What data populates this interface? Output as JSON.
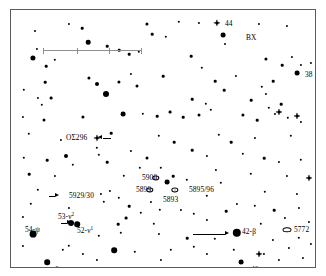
{
  "chart_data": {
    "type": "scatter",
    "title": "",
    "subtitle": "",
    "xlabel": "",
    "ylabel": "",
    "grid": false,
    "legend_position": "none",
    "xlim": [
      0,
      306
    ],
    "ylim": [
      0,
      259
    ],
    "scale_bar": {
      "x_start": 32,
      "x_end": 130,
      "y": 40,
      "ticks": [
        32,
        65.5,
        98,
        130
      ]
    },
    "labels": [
      {
        "text": "44",
        "x": 214,
        "y": 14,
        "align": "left"
      },
      {
        "text": "BX",
        "x": 235,
        "y": 28,
        "align": "left"
      },
      {
        "text": "38",
        "x": 294,
        "y": 65,
        "align": "left"
      },
      {
        "text": "OΣ296",
        "x": 55,
        "y": 128,
        "align": "left"
      },
      {
        "text": "5900",
        "x": 131,
        "y": 168,
        "align": "left"
      },
      {
        "text": "5899",
        "x": 125,
        "y": 180,
        "align": "left"
      },
      {
        "text": "5895/96",
        "x": 178,
        "y": 180,
        "align": "left"
      },
      {
        "text": "5893",
        "x": 152,
        "y": 190,
        "align": "left"
      },
      {
        "text": "5929/30",
        "x": 58,
        "y": 186,
        "align": "left"
      },
      {
        "text": "53-ν",
        "sup": "2",
        "x": 47,
        "y": 207,
        "align": "left"
      },
      {
        "text": "52-ν",
        "sup": "1",
        "x": 66,
        "y": 221,
        "align": "left"
      },
      {
        "text": "54-ψ",
        "x": 14,
        "y": 220,
        "align": "left"
      },
      {
        "text": "6-μ",
        "x": 44,
        "y": 260,
        "align": "left"
      },
      {
        "text": "42-β",
        "x": 231,
        "y": 222,
        "align": "left"
      },
      {
        "text": "5772",
        "x": 283,
        "y": 220,
        "align": "left"
      },
      {
        "text": "40",
        "x": 240,
        "y": 260,
        "align": "left"
      }
    ],
    "stars": [
      {
        "x": 24,
        "y": 21,
        "r": 1.0
      },
      {
        "x": 71,
        "y": 18,
        "r": 1.3
      },
      {
        "x": 77,
        "y": 32,
        "r": 2.3
      },
      {
        "x": 136,
        "y": 14,
        "r": 1.6
      },
      {
        "x": 141,
        "y": 24,
        "r": 1.3
      },
      {
        "x": 155,
        "y": 27,
        "r": 1.2
      },
      {
        "x": 96,
        "y": 36,
        "r": 1.3
      },
      {
        "x": 108,
        "y": 40,
        "r": 1.3
      },
      {
        "x": 118,
        "y": 44,
        "r": 1.3
      },
      {
        "x": 128,
        "y": 42,
        "r": 1.2
      },
      {
        "x": 26,
        "y": 39,
        "r": 1.1
      },
      {
        "x": 22,
        "y": 48,
        "r": 2.6
      },
      {
        "x": 35,
        "y": 56,
        "r": 1.3
      },
      {
        "x": 180,
        "y": 46,
        "r": 1.3
      },
      {
        "x": 191,
        "y": 58,
        "r": 1.2
      },
      {
        "x": 255,
        "y": 49,
        "r": 1.6
      },
      {
        "x": 271,
        "y": 55,
        "r": 1.3
      },
      {
        "x": 281,
        "y": 47,
        "r": 1.1
      },
      {
        "x": 290,
        "y": 55,
        "r": 1.1
      },
      {
        "x": 300,
        "y": 53,
        "r": 1.1
      },
      {
        "x": 286,
        "y": 63,
        "r": 2.4
      },
      {
        "x": 262,
        "y": 71,
        "r": 1.3
      },
      {
        "x": 251,
        "y": 77,
        "r": 1.2
      },
      {
        "x": 255,
        "y": 84,
        "r": 1.1
      },
      {
        "x": 34,
        "y": 72,
        "r": 1.3
      },
      {
        "x": 78,
        "y": 68,
        "r": 1.6
      },
      {
        "x": 86,
        "y": 74,
        "r": 2.0
      },
      {
        "x": 120,
        "y": 64,
        "r": 1.1
      },
      {
        "x": 108,
        "y": 72,
        "r": 1.6
      },
      {
        "x": 126,
        "y": 76,
        "r": 1.5
      },
      {
        "x": 152,
        "y": 66,
        "r": 1.3
      },
      {
        "x": 204,
        "y": 71,
        "r": 1.3
      },
      {
        "x": 213,
        "y": 80,
        "r": 1.3
      },
      {
        "x": 225,
        "y": 66,
        "r": 1.1
      },
      {
        "x": 13,
        "y": 80,
        "r": 1.2
      },
      {
        "x": 27,
        "y": 88,
        "r": 1.1
      },
      {
        "x": 31,
        "y": 95,
        "r": 1.2
      },
      {
        "x": 40,
        "y": 88,
        "r": 1.4
      },
      {
        "x": 95,
        "y": 84,
        "r": 3.0
      },
      {
        "x": 181,
        "y": 89,
        "r": 1.3
      },
      {
        "x": 195,
        "y": 94,
        "r": 1.2
      },
      {
        "x": 240,
        "y": 90,
        "r": 1.3
      },
      {
        "x": 258,
        "y": 98,
        "r": 1.2
      },
      {
        "x": 270,
        "y": 94,
        "r": 1.3
      },
      {
        "x": 12,
        "y": 107,
        "r": 1.1
      },
      {
        "x": 33,
        "y": 110,
        "r": 1.5
      },
      {
        "x": 72,
        "y": 107,
        "r": 1.6
      },
      {
        "x": 112,
        "y": 104,
        "r": 2.4
      },
      {
        "x": 132,
        "y": 104,
        "r": 1.2
      },
      {
        "x": 146,
        "y": 106,
        "r": 1.3
      },
      {
        "x": 159,
        "y": 102,
        "r": 1.4
      },
      {
        "x": 172,
        "y": 107,
        "r": 1.3
      },
      {
        "x": 188,
        "y": 105,
        "r": 1.5
      },
      {
        "x": 200,
        "y": 100,
        "r": 1.2
      },
      {
        "x": 232,
        "y": 105,
        "r": 1.6
      },
      {
        "x": 246,
        "y": 110,
        "r": 1.3
      },
      {
        "x": 264,
        "y": 104,
        "r": 1.1
      },
      {
        "x": 277,
        "y": 108,
        "r": 1.2
      },
      {
        "x": 290,
        "y": 112,
        "r": 1.1
      },
      {
        "x": 18,
        "y": 124,
        "r": 1.2
      },
      {
        "x": 50,
        "y": 130,
        "r": 1.1
      },
      {
        "x": 100,
        "y": 123,
        "r": 1.3
      },
      {
        "x": 148,
        "y": 126,
        "r": 1.2
      },
      {
        "x": 163,
        "y": 132,
        "r": 1.3
      },
      {
        "x": 208,
        "y": 125,
        "r": 1.2
      },
      {
        "x": 220,
        "y": 132,
        "r": 1.3
      },
      {
        "x": 244,
        "y": 128,
        "r": 1.1
      },
      {
        "x": 280,
        "y": 126,
        "r": 1.2
      },
      {
        "x": 86,
        "y": 138,
        "r": 1.2
      },
      {
        "x": 88,
        "y": 145,
        "r": 1.2
      },
      {
        "x": 120,
        "y": 141,
        "r": 1.1
      },
      {
        "x": 181,
        "y": 140,
        "r": 1.3
      },
      {
        "x": 196,
        "y": 146,
        "r": 1.1
      },
      {
        "x": 232,
        "y": 144,
        "r": 1.2
      },
      {
        "x": 13,
        "y": 148,
        "r": 1.2
      },
      {
        "x": 36,
        "y": 150,
        "r": 1.3
      },
      {
        "x": 55,
        "y": 146,
        "r": 2.0
      },
      {
        "x": 62,
        "y": 155,
        "r": 1.2
      },
      {
        "x": 96,
        "y": 152,
        "r": 1.3
      },
      {
        "x": 136,
        "y": 148,
        "r": 1.5
      },
      {
        "x": 150,
        "y": 158,
        "r": 1.2
      },
      {
        "x": 253,
        "y": 148,
        "r": 1.3
      },
      {
        "x": 268,
        "y": 152,
        "r": 1.1
      },
      {
        "x": 290,
        "y": 150,
        "r": 1.2
      },
      {
        "x": 18,
        "y": 164,
        "r": 1.3
      },
      {
        "x": 44,
        "y": 166,
        "r": 1.1
      },
      {
        "x": 113,
        "y": 166,
        "r": 1.2
      },
      {
        "x": 129,
        "y": 158,
        "r": 1.2
      },
      {
        "x": 162,
        "y": 166,
        "r": 1.3
      },
      {
        "x": 205,
        "y": 160,
        "r": 1.1
      },
      {
        "x": 240,
        "y": 164,
        "r": 1.2
      },
      {
        "x": 276,
        "y": 166,
        "r": 1.1
      },
      {
        "x": 156,
        "y": 172,
        "r": 2.4
      },
      {
        "x": 176,
        "y": 170,
        "r": 1.2
      },
      {
        "x": 210,
        "y": 173,
        "r": 1.2
      },
      {
        "x": 27,
        "y": 180,
        "r": 1.2
      },
      {
        "x": 90,
        "y": 184,
        "r": 1.1
      },
      {
        "x": 99,
        "y": 181,
        "r": 1.1
      },
      {
        "x": 93,
        "y": 192,
        "r": 1.2
      },
      {
        "x": 108,
        "y": 188,
        "r": 1.2
      },
      {
        "x": 140,
        "y": 192,
        "r": 1.1
      },
      {
        "x": 196,
        "y": 186,
        "r": 1.2
      },
      {
        "x": 254,
        "y": 182,
        "r": 1.2
      },
      {
        "x": 286,
        "y": 184,
        "r": 1.1
      },
      {
        "x": 20,
        "y": 194,
        "r": 1.2
      },
      {
        "x": 58,
        "y": 198,
        "r": 1.1
      },
      {
        "x": 118,
        "y": 196,
        "r": 1.3
      },
      {
        "x": 130,
        "y": 203,
        "r": 1.2
      },
      {
        "x": 115,
        "y": 208,
        "r": 1.4
      },
      {
        "x": 149,
        "y": 200,
        "r": 1.2
      },
      {
        "x": 170,
        "y": 200,
        "r": 1.1
      },
      {
        "x": 183,
        "y": 204,
        "r": 1.2
      },
      {
        "x": 215,
        "y": 201,
        "r": 1.3
      },
      {
        "x": 226,
        "y": 194,
        "r": 1.1
      },
      {
        "x": 244,
        "y": 196,
        "r": 1.2
      },
      {
        "x": 263,
        "y": 200,
        "r": 1.3
      },
      {
        "x": 288,
        "y": 198,
        "r": 1.1
      },
      {
        "x": 12,
        "y": 207,
        "r": 1.1
      },
      {
        "x": 107,
        "y": 214,
        "r": 1.3
      },
      {
        "x": 143,
        "y": 214,
        "r": 1.2
      },
      {
        "x": 196,
        "y": 210,
        "r": 1.1
      },
      {
        "x": 250,
        "y": 214,
        "r": 1.2
      },
      {
        "x": 274,
        "y": 208,
        "r": 1.1
      },
      {
        "x": 298,
        "y": 212,
        "r": 1.1
      },
      {
        "x": 60,
        "y": 213,
        "r": 3.0
      },
      {
        "x": 66,
        "y": 214,
        "r": 2.8
      },
      {
        "x": 22,
        "y": 224,
        "r": 3.4
      },
      {
        "x": 226,
        "y": 223,
        "r": 4.2
      },
      {
        "x": 88,
        "y": 226,
        "r": 1.2
      },
      {
        "x": 110,
        "y": 223,
        "r": 1.2
      },
      {
        "x": 148,
        "y": 224,
        "r": 1.1
      },
      {
        "x": 176,
        "y": 228,
        "r": 1.3
      },
      {
        "x": 204,
        "y": 229,
        "r": 1.2
      },
      {
        "x": 262,
        "y": 230,
        "r": 1.1
      },
      {
        "x": 288,
        "y": 228,
        "r": 1.2
      },
      {
        "x": 12,
        "y": 236,
        "r": 1.1
      },
      {
        "x": 52,
        "y": 240,
        "r": 1.2
      },
      {
        "x": 58,
        "y": 236,
        "r": 1.2
      },
      {
        "x": 72,
        "y": 244,
        "r": 1.1
      },
      {
        "x": 103,
        "y": 240,
        "r": 2.8
      },
      {
        "x": 124,
        "y": 242,
        "r": 1.2
      },
      {
        "x": 160,
        "y": 240,
        "r": 1.2
      },
      {
        "x": 183,
        "y": 237,
        "r": 1.2
      },
      {
        "x": 196,
        "y": 244,
        "r": 1.1
      },
      {
        "x": 223,
        "y": 240,
        "r": 1.2
      },
      {
        "x": 253,
        "y": 244,
        "r": 1.1
      },
      {
        "x": 278,
        "y": 238,
        "r": 1.1
      },
      {
        "x": 300,
        "y": 234,
        "r": 1.1
      },
      {
        "x": 36,
        "y": 252,
        "r": 2.8
      },
      {
        "x": 150,
        "y": 250,
        "r": 1.1
      },
      {
        "x": 230,
        "y": 252,
        "r": 2.4
      },
      {
        "x": 268,
        "y": 250,
        "r": 1.1
      },
      {
        "x": 292,
        "y": 248,
        "r": 1.1
      },
      {
        "x": 86,
        "y": 250,
        "r": 1.1
      },
      {
        "x": 212,
        "y": 25,
        "r": 2.4
      },
      {
        "x": 214,
        "y": 34,
        "r": 1.0
      },
      {
        "x": 168,
        "y": 12,
        "r": 1.2
      },
      {
        "x": 188,
        "y": 13,
        "r": 1.1
      },
      {
        "x": 58,
        "y": 14,
        "r": 1.1
      },
      {
        "x": 44,
        "y": 50,
        "r": 1.2
      },
      {
        "x": 248,
        "y": 14,
        "r": 1.1
      },
      {
        "x": 276,
        "y": 16,
        "r": 1.1
      }
    ],
    "double_star_markers": [
      {
        "x": 86,
        "y": 128,
        "size": 6.2
      },
      {
        "x": 298,
        "y": 168,
        "size": 6.2
      },
      {
        "x": 268,
        "y": 102,
        "size": 6.2
      },
      {
        "x": 286,
        "y": 106,
        "size": 6.2
      },
      {
        "x": 248,
        "y": 244,
        "size": 6.2
      },
      {
        "x": 206,
        "y": 13,
        "size": 6.4
      }
    ],
    "open_clusters": [
      {
        "x": 145,
        "y": 168,
        "w": 5.4,
        "h": 3.2
      },
      {
        "x": 139,
        "y": 180,
        "w": 5.4,
        "h": 3.2
      },
      {
        "x": 164,
        "y": 180,
        "w": 5.4,
        "h": 3.2
      }
    ],
    "galaxies": [
      {
        "x": 276,
        "y": 220,
        "w": 7.0,
        "h": 3.4
      }
    ],
    "pointers": [
      {
        "x1": 182,
        "y1": 224,
        "x2": 214,
        "y2": 224,
        "dir": "right"
      },
      {
        "x1": 50,
        "y1": 213,
        "x2": 56,
        "y2": 213,
        "dir": "right"
      },
      {
        "x1": 38,
        "y1": 186,
        "x2": 44,
        "y2": 186,
        "dir": "right"
      },
      {
        "x1": 100,
        "y1": 128,
        "x2": 92,
        "y2": 128,
        "dir": "left"
      }
    ]
  }
}
